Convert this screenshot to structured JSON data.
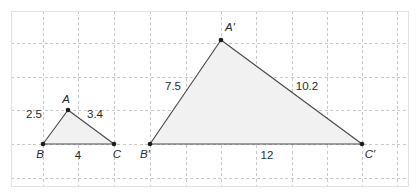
{
  "figure": {
    "colors": {
      "triangle_fill": "#f1f1f1",
      "triangle_stroke": "#4a4a4a",
      "grid": "#c9c9c9",
      "frame": "#e2e2e2",
      "vertex_dot": "#1c1c1c",
      "label_text": "#2b2b2b",
      "background": "#ffffff"
    },
    "grid": {
      "style": "dashed",
      "x_lines": [
        43,
        78,
        114,
        150,
        186,
        221,
        256,
        292,
        327,
        362,
        397
      ],
      "y_lines": [
        43,
        77,
        110,
        144,
        178
      ],
      "frame": {
        "x": 11,
        "y": 11,
        "width": 397,
        "height": 175
      }
    },
    "triangles": [
      {
        "name": "small-triangle-abc",
        "vertices": [
          {
            "id": "A",
            "label": "A",
            "x": 68,
            "y": 110,
            "label_x": 66,
            "label_y": 103,
            "label_anchor": "middle"
          },
          {
            "id": "B",
            "label": "B",
            "x": 43,
            "y": 144,
            "label_x": 40,
            "label_y": 158,
            "label_anchor": "middle"
          },
          {
            "id": "C",
            "label": "C",
            "x": 114,
            "y": 144,
            "label_x": 117,
            "label_y": 158,
            "label_anchor": "middle"
          }
        ],
        "side_labels": [
          {
            "id": "AB",
            "value": "2.5",
            "x": 34,
            "y": 118,
            "anchor": "middle"
          },
          {
            "id": "AC",
            "value": "3.4",
            "x": 95,
            "y": 118,
            "anchor": "middle"
          },
          {
            "id": "BC",
            "value": "4",
            "x": 78,
            "y": 159,
            "anchor": "middle"
          }
        ]
      },
      {
        "name": "large-triangle-a-prime-b-prime-c-prime",
        "vertices": [
          {
            "id": "A'",
            "label": "A′",
            "x": 221,
            "y": 40,
            "label_x": 230,
            "label_y": 31,
            "label_anchor": "middle"
          },
          {
            "id": "B'",
            "label": "B′",
            "x": 150,
            "y": 144,
            "label_x": 145,
            "label_y": 158,
            "label_anchor": "middle"
          },
          {
            "id": "C'",
            "label": "C′",
            "x": 362,
            "y": 144,
            "label_x": 370,
            "label_y": 158,
            "label_anchor": "middle"
          }
        ],
        "side_labels": [
          {
            "id": "A'B'",
            "value": "7.5",
            "x": 173,
            "y": 90,
            "anchor": "middle"
          },
          {
            "id": "A'C'",
            "value": "10.2",
            "x": 307,
            "y": 90,
            "anchor": "middle"
          },
          {
            "id": "B'C'",
            "value": "12",
            "x": 267,
            "y": 159,
            "anchor": "middle"
          }
        ]
      }
    ]
  }
}
